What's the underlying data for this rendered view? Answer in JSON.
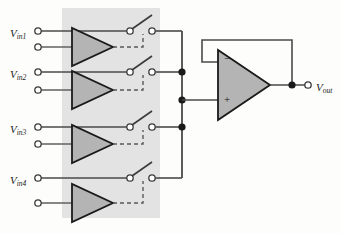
{
  "figure": {
    "kind": "analog-multiplexer-schematic",
    "background_color": "#fdfdfc",
    "shade_color": "#e3e3e3",
    "amp_fill": "#b4b4b4",
    "wire_color": "#4a4a4a",
    "outline_color": "#1a1a1a"
  },
  "shaded_region": {
    "x": 62,
    "y": 8,
    "width": 98,
    "height": 210
  },
  "inputs": [
    {
      "name": "vin1",
      "label_v": "V",
      "label_sub": "in1",
      "label_x": 10,
      "label_y": 25,
      "signal_y": 31,
      "ground_y": 47,
      "amp_cx": 70,
      "amp_cy": 47,
      "switch_y": 31
    },
    {
      "name": "vin2",
      "label_v": "V",
      "label_sub": "in2",
      "label_x": 10,
      "label_y": 66,
      "signal_y": 72,
      "ground_y": 90,
      "amp_cx": 70,
      "amp_cy": 90,
      "switch_y": 72
    },
    {
      "name": "vin3",
      "label_v": "V",
      "label_sub": "in3",
      "label_x": 10,
      "label_y": 121,
      "signal_y": 127,
      "ground_y": 144,
      "amp_cx": 70,
      "amp_cy": 144,
      "switch_y": 127
    },
    {
      "name": "vin4",
      "label_v": "V",
      "label_sub": "in4",
      "label_x": 10,
      "label_y": 172,
      "signal_y": 178,
      "ground_y": 203,
      "amp_cx": 70,
      "amp_cy": 203,
      "switch_y": 178
    }
  ],
  "output": {
    "name": "vout",
    "label_v": "V",
    "label_sub": "out",
    "label_x": 318,
    "label_y": 79,
    "terminal_x": 308,
    "terminal_y": 85,
    "junction_x": 292,
    "junction_y": 85
  },
  "opamp": {
    "minus_symbol": "−",
    "plus_symbol": "+",
    "apex_x": 270,
    "tip_y": 85,
    "left_x": 218,
    "top_y": 50,
    "bottom_y": 120,
    "minus_label_x": 224,
    "minus_label_y": 58,
    "plus_label_x": 224,
    "plus_label_y": 95,
    "feedback_top_y": 40,
    "feedback_left_x": 202
  },
  "bus": {
    "x": 182,
    "top_y": 31,
    "bottom_y": 178,
    "junction_ys": [
      72,
      100,
      127
    ]
  },
  "switches": {
    "left_terminal_x": 130,
    "right_terminal_x": 152,
    "blade_tip_x": 150,
    "blade_rise": 16,
    "control_x": 143
  },
  "terminals": {
    "input_x": 38,
    "radius": 3.2
  }
}
